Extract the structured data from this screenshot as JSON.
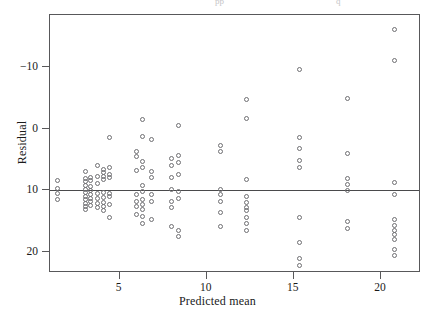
{
  "figure": {
    "type": "scatter-residual-plot",
    "background_color": "#ffffff",
    "frame_color": "#58585a",
    "marker_color": "#6e6e72",
    "top_cropped_text_left": "pp",
    "top_cropped_text_right": "q"
  },
  "axes": {
    "x_title": "Predicted mean",
    "y_title": "Residual",
    "x_ticks": [
      "5",
      "10",
      "15",
      "20"
    ],
    "y_ticks": [
      "20",
      "10",
      "0",
      "−10"
    ]
  },
  "chart_data": {
    "type": "scatter",
    "title": "",
    "xlabel": "Predicted mean",
    "ylabel": "Residual",
    "xlim": [
      1.0,
      22.3
    ],
    "ylim": [
      -13.5,
      28.5
    ],
    "grid": false,
    "legend": null,
    "x_tick_values": [
      5,
      10,
      15,
      20
    ],
    "y_tick_values": [
      -10,
      0,
      10,
      20
    ],
    "reference_lines": [
      {
        "orientation": "horizontal",
        "y": 0,
        "style": "solid"
      }
    ],
    "series": [
      {
        "name": "residuals",
        "marker": "open-circle",
        "points": [
          [
            1.45,
            1.6
          ],
          [
            1.45,
            0.3
          ],
          [
            1.45,
            -0.6
          ],
          [
            1.45,
            -1.5
          ],
          [
            3.05,
            3.0
          ],
          [
            3.05,
            1.9
          ],
          [
            3.05,
            1.4
          ],
          [
            3.05,
            0.8
          ],
          [
            3.05,
            0.1
          ],
          [
            3.05,
            -0.4
          ],
          [
            3.05,
            -1.0
          ],
          [
            3.05,
            -1.6
          ],
          [
            3.05,
            -2.2
          ],
          [
            3.05,
            -2.6
          ],
          [
            3.05,
            -3.2
          ],
          [
            3.35,
            2.1
          ],
          [
            3.35,
            1.5
          ],
          [
            3.35,
            0.6
          ],
          [
            3.35,
            -0.1
          ],
          [
            3.35,
            -0.7
          ],
          [
            3.35,
            -1.3
          ],
          [
            3.35,
            -1.9
          ],
          [
            3.35,
            -2.5
          ],
          [
            3.75,
            4.0
          ],
          [
            3.75,
            2.2
          ],
          [
            3.75,
            1.0
          ],
          [
            3.75,
            -0.6
          ],
          [
            3.75,
            -1.4
          ],
          [
            3.75,
            -2.2
          ],
          [
            3.75,
            -2.9
          ],
          [
            4.1,
            3.3
          ],
          [
            4.1,
            2.8
          ],
          [
            4.1,
            2.2
          ],
          [
            4.1,
            1.7
          ],
          [
            4.1,
            -0.4
          ],
          [
            4.1,
            -1.2
          ],
          [
            4.1,
            -2.0
          ],
          [
            4.1,
            -2.7
          ],
          [
            4.1,
            -3.4
          ],
          [
            4.4,
            8.5
          ],
          [
            4.4,
            3.6
          ],
          [
            4.4,
            2.6
          ],
          [
            4.4,
            2.0
          ],
          [
            4.4,
            -0.5
          ],
          [
            4.4,
            -1.1
          ],
          [
            4.4,
            -2.3
          ],
          [
            4.4,
            -4.5
          ],
          [
            5.95,
            6.2
          ],
          [
            5.95,
            5.4
          ],
          [
            5.95,
            3.2
          ],
          [
            5.95,
            -0.8
          ],
          [
            5.95,
            -1.9
          ],
          [
            5.95,
            -2.6
          ],
          [
            5.95,
            -3.9
          ],
          [
            6.3,
            11.5
          ],
          [
            6.3,
            8.8
          ],
          [
            6.3,
            4.7
          ],
          [
            6.3,
            3.6
          ],
          [
            6.3,
            0.7
          ],
          [
            6.3,
            -0.3
          ],
          [
            6.3,
            -1.6
          ],
          [
            6.3,
            -2.4
          ],
          [
            6.3,
            -3.1
          ],
          [
            6.3,
            -4.3
          ],
          [
            6.3,
            -5.4
          ],
          [
            6.85,
            8.2
          ],
          [
            6.85,
            3.1
          ],
          [
            6.85,
            2.1
          ],
          [
            6.85,
            -0.8
          ],
          [
            6.85,
            -1.8
          ],
          [
            6.85,
            -4.8
          ],
          [
            7.95,
            5.1
          ],
          [
            7.95,
            4.0
          ],
          [
            7.95,
            2.0
          ],
          [
            7.95,
            0.1
          ],
          [
            7.95,
            -1.8
          ],
          [
            7.95,
            -2.9
          ],
          [
            7.95,
            -6.0
          ],
          [
            8.4,
            10.5
          ],
          [
            8.4,
            5.6
          ],
          [
            8.4,
            4.5
          ],
          [
            8.4,
            2.5
          ],
          [
            8.4,
            -0.3
          ],
          [
            8.4,
            -1.4
          ],
          [
            8.4,
            -6.6
          ],
          [
            8.4,
            -7.6
          ],
          [
            10.8,
            7.2
          ],
          [
            10.8,
            6.2
          ],
          [
            10.8,
            0.1
          ],
          [
            10.8,
            -0.8
          ],
          [
            10.8,
            -1.9
          ],
          [
            10.8,
            -3.7
          ],
          [
            10.8,
            -5.9
          ],
          [
            12.3,
            14.7
          ],
          [
            12.3,
            11.6
          ],
          [
            12.3,
            1.7
          ],
          [
            12.3,
            -1.1
          ],
          [
            12.3,
            -2.1
          ],
          [
            12.3,
            -2.8
          ],
          [
            12.3,
            -3.4
          ],
          [
            12.3,
            -4.5
          ],
          [
            12.3,
            -5.4
          ],
          [
            12.3,
            -6.5
          ],
          [
            15.3,
            19.6
          ],
          [
            15.3,
            8.5
          ],
          [
            15.3,
            6.7
          ],
          [
            15.3,
            4.8
          ],
          [
            15.3,
            3.6
          ],
          [
            15.3,
            -4.4
          ],
          [
            15.3,
            -8.5
          ],
          [
            15.3,
            -11.1
          ],
          [
            15.3,
            -12.2
          ],
          [
            18.1,
            14.9
          ],
          [
            18.1,
            6.0
          ],
          [
            18.1,
            1.9
          ],
          [
            18.1,
            0.9
          ],
          [
            18.1,
            0.0
          ],
          [
            18.1,
            -5.1
          ],
          [
            18.1,
            -6.2
          ],
          [
            20.8,
            26.2
          ],
          [
            20.8,
            21.1
          ],
          [
            20.8,
            1.2
          ],
          [
            20.8,
            -0.7
          ],
          [
            20.8,
            -4.8
          ],
          [
            20.8,
            -5.7
          ],
          [
            20.8,
            -6.5
          ],
          [
            20.8,
            -7.3
          ],
          [
            20.8,
            -8.0
          ],
          [
            20.8,
            -9.6
          ],
          [
            20.8,
            -10.7
          ]
        ]
      }
    ]
  }
}
